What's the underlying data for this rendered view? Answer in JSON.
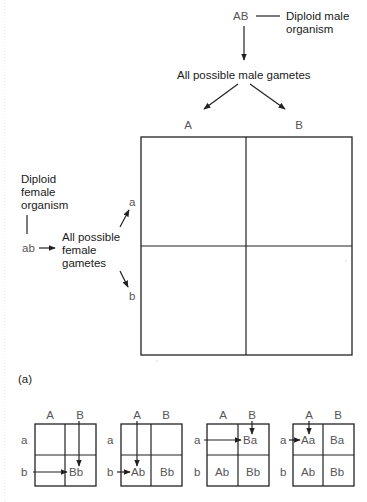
{
  "male": {
    "genotype": "AB",
    "label_line1": "Diploid male",
    "label_line2": "organism",
    "gametes_label": "All possible male gametes",
    "gametes": [
      "A",
      "B"
    ]
  },
  "female": {
    "label_line1": "Diploid",
    "label_line2": "female",
    "label_line3": "organism",
    "genotype": "ab",
    "gametes_line1": "All possible",
    "gametes_line2": "female",
    "gametes_line3": "gametes",
    "gametes": [
      "a",
      "b"
    ]
  },
  "panel_label": "(a)",
  "small_grids": [
    {
      "cols": [
        "A",
        "B"
      ],
      "rows": [
        "a",
        "b"
      ],
      "cells": [
        "",
        "",
        "",
        "Bb"
      ]
    },
    {
      "cols": [
        "A",
        "B"
      ],
      "rows": [
        "a",
        "b"
      ],
      "cells": [
        "",
        "",
        "Ab",
        "Bb"
      ]
    },
    {
      "cols": [
        "A",
        "B"
      ],
      "rows": [
        "a",
        "b"
      ],
      "cells": [
        "",
        "Ba",
        "Ab",
        "Bb"
      ]
    },
    {
      "cols": [
        "A",
        "B"
      ],
      "rows": [
        "a",
        "b"
      ],
      "cells": [
        "Aa",
        "Ba",
        "Ab",
        "Bb"
      ]
    }
  ],
  "colors": {
    "line": "#222222",
    "allele_text": "#555555",
    "label_text": "#1a1a1a"
  }
}
